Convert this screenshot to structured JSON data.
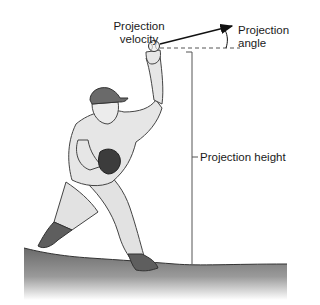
{
  "diagram": {
    "labels": {
      "projection_velocity": [
        "Projection",
        "velocity"
      ],
      "projection_angle": [
        "Projection",
        "angle"
      ],
      "projection_height": "Projection height"
    },
    "colors": {
      "line": "#333333",
      "ground_top": "#6e6e6e",
      "ground_bottom": "#ffffff",
      "uniform": "#e4e4e4",
      "cap": "#6a6a6a",
      "shoe": "#5c5c5c",
      "glove": "#3a3a3a"
    }
  }
}
